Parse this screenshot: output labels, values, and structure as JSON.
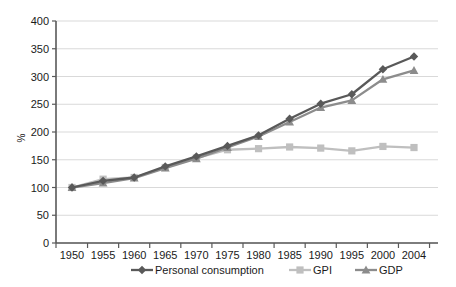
{
  "chart_data": {
    "type": "line",
    "title": "",
    "xlabel": "",
    "ylabel": "%",
    "categories": [
      "1950",
      "1955",
      "1960",
      "1965",
      "1970",
      "1975",
      "1980",
      "1985",
      "1990",
      "1995",
      "2000",
      "2004"
    ],
    "x": [
      1950,
      1955,
      1960,
      1965,
      1970,
      1975,
      1980,
      1985,
      1990,
      1995,
      2000,
      2004
    ],
    "ylim": [
      0,
      400
    ],
    "ytick_labels": [
      "0",
      "50",
      "100",
      "150",
      "200",
      "250",
      "300",
      "350",
      "400"
    ],
    "yticks": [
      0,
      50,
      100,
      150,
      200,
      250,
      300,
      350,
      400
    ],
    "grid": true,
    "legend_position": "bottom",
    "series": [
      {
        "name": "Personal consumption",
        "color": "#595959",
        "marker": "diamond",
        "values": [
          100,
          112,
          118,
          138,
          156,
          175,
          194,
          224,
          251,
          268,
          313,
          336
        ]
      },
      {
        "name": "GPI",
        "color": "#bfbfbf",
        "marker": "square",
        "values": [
          100,
          115,
          118,
          136,
          153,
          168,
          170,
          173,
          171,
          166,
          174,
          172
        ]
      },
      {
        "name": "GDP",
        "color": "#8c8c8c",
        "marker": "triangle",
        "values": [
          100,
          108,
          117,
          135,
          152,
          172,
          192,
          218,
          244,
          257,
          295,
          311
        ]
      }
    ]
  },
  "legend": {
    "items": [
      {
        "label": "Personal consumption"
      },
      {
        "label": "GPI"
      },
      {
        "label": "GDP"
      }
    ]
  },
  "axes": {
    "y_title": "%"
  }
}
